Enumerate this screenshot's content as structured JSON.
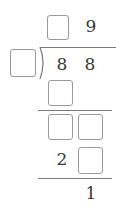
{
  "problem": {
    "type": "long-division",
    "quotient": {
      "tens": "",
      "ones": "9"
    },
    "divisor": "",
    "dividend": {
      "tens": "8",
      "ones": "8"
    },
    "step1_product": {
      "tens": ""
    },
    "step1_remainder_row": {
      "tens": "",
      "ones": ""
    },
    "step2_product": {
      "tens": "2",
      "ones": ""
    },
    "remainder": "1"
  },
  "colors": {
    "text": "#3a3a3a",
    "box_border": "#9a9a9a",
    "line": "#7a7a7a"
  }
}
